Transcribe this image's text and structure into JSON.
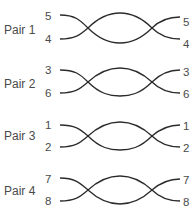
{
  "diagram": {
    "type": "twisted-pair wiring",
    "stroke_color": "#2b2b2b",
    "pairs": [
      {
        "label": "Pair 1",
        "top_pin": "5",
        "bottom_pin": "4"
      },
      {
        "label": "Pair 2",
        "top_pin": "3",
        "bottom_pin": "6"
      },
      {
        "label": "Pair 3",
        "top_pin": "1",
        "bottom_pin": "2"
      },
      {
        "label": "Pair 4",
        "top_pin": "7",
        "bottom_pin": "8"
      }
    ]
  }
}
